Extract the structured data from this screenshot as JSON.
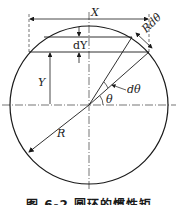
{
  "diagram": {
    "labels": {
      "x": "X",
      "dy": "dY",
      "rdtheta": "Rdθ",
      "y": "Y",
      "dtheta": "dθ",
      "theta": "θ",
      "r": "R"
    },
    "caption": "图 6-2   圆环的惯性矩",
    "colors": {
      "line": "#1a1a1a",
      "background": "#ffffff"
    }
  }
}
